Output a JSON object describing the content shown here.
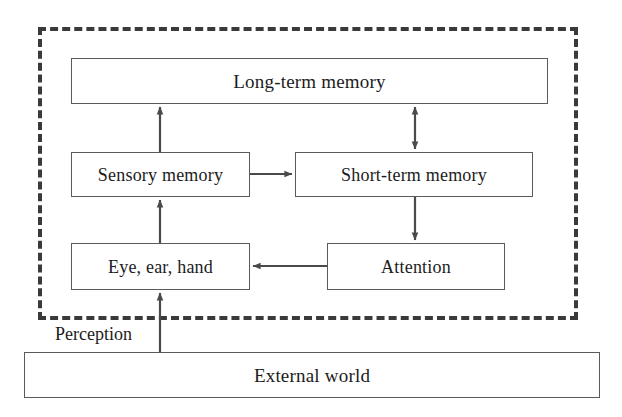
{
  "diagram": {
    "colors": {
      "box_border": "#5a5a5a",
      "boundary_border": "#3a3a3a",
      "arrow": "#4a4a4a",
      "text": "#1c1c1c",
      "background": "#ffffff"
    },
    "boundary": {
      "name": "human-boundary",
      "style": "dashed"
    },
    "nodes": [
      {
        "id": "long-term-memory",
        "label": "Long-term memory"
      },
      {
        "id": "sensory-memory",
        "label": "Sensory memory"
      },
      {
        "id": "short-term-memory",
        "label": "Short-term memory"
      },
      {
        "id": "eye-ear-hand",
        "label": "Eye, ear, hand"
      },
      {
        "id": "attention",
        "label": "Attention"
      },
      {
        "id": "external-world",
        "label": "External world"
      }
    ],
    "edge_labels": [
      {
        "id": "perception",
        "label": "Perception"
      }
    ],
    "edges": [
      {
        "from": "sensory-memory",
        "to": "long-term-memory",
        "arrow": "single"
      },
      {
        "from": "long-term-memory",
        "to": "short-term-memory",
        "arrow": "double"
      },
      {
        "from": "sensory-memory",
        "to": "short-term-memory",
        "arrow": "single"
      },
      {
        "from": "short-term-memory",
        "to": "attention",
        "arrow": "single"
      },
      {
        "from": "attention",
        "to": "eye-ear-hand",
        "arrow": "single"
      },
      {
        "from": "eye-ear-hand",
        "to": "sensory-memory",
        "arrow": "single"
      },
      {
        "from": "external-world",
        "to": "eye-ear-hand",
        "arrow": "single",
        "label": "Perception"
      }
    ]
  }
}
